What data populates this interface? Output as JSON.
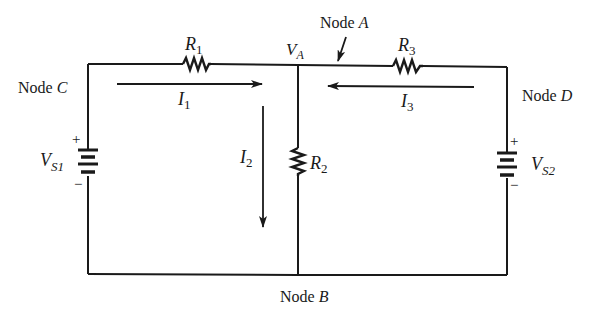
{
  "diagram": {
    "type": "circuit",
    "nodes": {
      "A": {
        "label": "Node",
        "letter": "A"
      },
      "B": {
        "label": "Node",
        "letter": "B"
      },
      "C": {
        "label": "Node",
        "letter": "C"
      },
      "D": {
        "label": "Node",
        "letter": "D"
      }
    },
    "voltage_node": {
      "symbol": "V",
      "sub": "A"
    },
    "resistors": [
      {
        "symbol": "R",
        "sub": "1"
      },
      {
        "symbol": "R",
        "sub": "2"
      },
      {
        "symbol": "R",
        "sub": "3"
      }
    ],
    "sources": [
      {
        "symbol": "V",
        "sub": "S1",
        "plus": "+",
        "minus": "−"
      },
      {
        "symbol": "V",
        "sub": "S2",
        "plus": "+",
        "minus": "−"
      }
    ],
    "currents": [
      {
        "symbol": "I",
        "sub": "1",
        "direction": "right"
      },
      {
        "symbol": "I",
        "sub": "2",
        "direction": "down"
      },
      {
        "symbol": "I",
        "sub": "3",
        "direction": "left"
      }
    ]
  }
}
